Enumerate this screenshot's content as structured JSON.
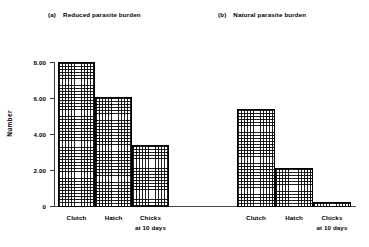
{
  "chart_data": {
    "type": "bar",
    "title": "",
    "ylabel": "Number",
    "xlabel": "",
    "ylim": [
      0,
      8.5
    ],
    "yticks": [
      "0",
      "2.00",
      "4.00",
      "6.00",
      "8.00"
    ],
    "ytick_values": [
      0,
      2,
      4,
      6,
      8
    ],
    "grid": false,
    "legend": "none",
    "categories": [
      "Clutch",
      "Hatch",
      "Chicks at 10 days"
    ],
    "panels": [
      {
        "tag": "(a)",
        "title": "Reduced parasite burden",
        "categories": [
          "Clutch",
          "Hatch",
          "Chicks at 10 days"
        ],
        "values": [
          8.0,
          6.05,
          3.4
        ]
      },
      {
        "tag": "(b)",
        "title": "Natural parasite burden",
        "categories": [
          "Clutch",
          "Hatch",
          "Chicks at 10 days"
        ],
        "values": [
          5.4,
          2.1,
          0.25
        ]
      }
    ]
  },
  "panel_a": {
    "tag": "(a)",
    "title": "Reduced parasite burden",
    "labels": {
      "clutch": "Clutch",
      "hatch": "Hatch",
      "chicks_l1": "Chicks",
      "chicks_l2": "at 10 days"
    }
  },
  "panel_b": {
    "tag": "(b)",
    "title": "Natural parasite burden",
    "labels": {
      "clutch": "Clutch",
      "hatch": "Hatch",
      "chicks_l1": "Chicks",
      "chicks_l2": "at 10 days"
    }
  },
  "axis": {
    "y_title": "Number",
    "y0": "0",
    "y2": "2.00",
    "y4": "4.00",
    "y6": "6.00",
    "y8": "8.00"
  }
}
